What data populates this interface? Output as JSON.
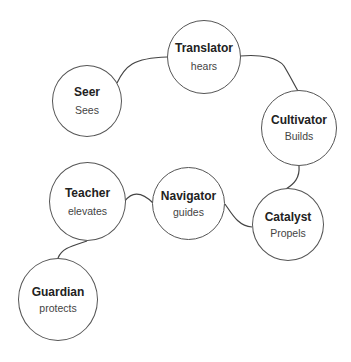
{
  "diagram": {
    "type": "role-chain",
    "line_color": "#444444",
    "nodes": [
      {
        "id": "seer",
        "title": "Seer",
        "subtitle": "Sees"
      },
      {
        "id": "translator",
        "title": "Translator",
        "subtitle": "hears"
      },
      {
        "id": "cultivator",
        "title": "Cultivator",
        "subtitle": "Builds"
      },
      {
        "id": "catalyst",
        "title": "Catalyst",
        "subtitle": "Propels"
      },
      {
        "id": "navigator",
        "title": "Navigator",
        "subtitle": "guides"
      },
      {
        "id": "teacher",
        "title": "Teacher",
        "subtitle": "elevates"
      },
      {
        "id": "guardian",
        "title": "Guardian",
        "subtitle": "protects"
      }
    ],
    "edges": [
      {
        "from": "seer",
        "to": "translator"
      },
      {
        "from": "translator",
        "to": "cultivator"
      },
      {
        "from": "cultivator",
        "to": "catalyst"
      },
      {
        "from": "catalyst",
        "to": "navigator"
      },
      {
        "from": "navigator",
        "to": "teacher"
      },
      {
        "from": "teacher",
        "to": "guardian"
      }
    ]
  }
}
